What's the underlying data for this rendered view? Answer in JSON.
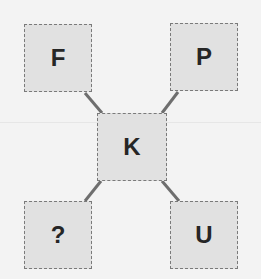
{
  "puzzle": {
    "center": {
      "label": "K"
    },
    "top_left": {
      "label": "F"
    },
    "top_right": {
      "label": "P"
    },
    "bottom_left": {
      "label": "?"
    },
    "bottom_right": {
      "label": "U"
    }
  },
  "colors": {
    "background": "#f3f3f3",
    "box_fill": "#e1e1e1",
    "box_border": "#7a7a7a",
    "connector": "#6e6e6e",
    "text": "#262626"
  }
}
